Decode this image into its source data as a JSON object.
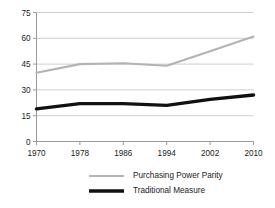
{
  "chart_data": {
    "type": "line",
    "title": "",
    "subtitle": "",
    "xlabel": "",
    "ylabel": "",
    "x": [
      1970,
      1978,
      1986,
      1994,
      2002,
      2010
    ],
    "xtick_labels": [
      "1970",
      "1978",
      "1986",
      "1994",
      "2002",
      "2010"
    ],
    "ytick_labels": [
      "0",
      "15",
      "30",
      "45",
      "60",
      "75"
    ],
    "yticks": [
      0,
      15,
      30,
      45,
      60,
      75
    ],
    "ylim": [
      0,
      75
    ],
    "xlim": [
      1970,
      2010
    ],
    "grid": "horizontal",
    "legend_position": "bottom",
    "series": [
      {
        "name": "Purchasing Power Parity",
        "values": [
          40,
          45,
          45.5,
          44,
          52.5,
          61
        ],
        "color": "#b3b3b3",
        "width": 2.1
      },
      {
        "name": "Traditional Measure",
        "values": [
          19,
          22,
          22,
          21,
          24.5,
          27
        ],
        "color": "#111111",
        "width": 3.4
      }
    ]
  },
  "axes": {
    "axis_color": "#9a9a9a",
    "grid_color": "#c8c8c8",
    "background": "#ffffff"
  },
  "legend": {
    "entries": [
      {
        "label": "Purchasing Power Parity",
        "swatch_name": "legend-swatch-ppp"
      },
      {
        "label": "Traditional Measure",
        "swatch_name": "legend-swatch-traditional"
      }
    ]
  }
}
